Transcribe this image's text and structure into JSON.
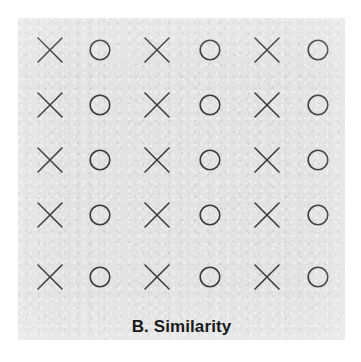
{
  "figure": {
    "caption": "B. Similarity",
    "panel_label": "B",
    "panel_title": "Similarity",
    "background_color": "#ffffff",
    "panel_color": "#e3e3e3",
    "glyph_color": "#3c3c3c",
    "caption_color": "#1a1a1a"
  },
  "grid": {
    "rows": 5,
    "columns": 6,
    "column_pattern": [
      "x",
      "o",
      "x",
      "o",
      "x",
      "o"
    ],
    "column_centers_px": [
      32,
      82,
      139,
      192,
      249,
      300
    ],
    "row_centers_px": [
      32,
      87,
      142,
      197,
      259
    ],
    "glyph_size_px": 24,
    "stroke_width_px": 1.6,
    "cells": [
      [
        "x",
        "o",
        "x",
        "o",
        "x",
        "o"
      ],
      [
        "x",
        "o",
        "x",
        "o",
        "x",
        "o"
      ],
      [
        "x",
        "o",
        "x",
        "o",
        "x",
        "o"
      ],
      [
        "x",
        "o",
        "x",
        "o",
        "x",
        "o"
      ],
      [
        "x",
        "o",
        "x",
        "o",
        "x",
        "o"
      ]
    ],
    "glyph_names": {
      "x": "cross-glyph",
      "o": "circle-glyph"
    }
  },
  "chart_data": {
    "type": "scatter",
    "title": "B. Similarity",
    "xlabel": "",
    "ylabel": "",
    "categories": [
      "column-1",
      "column-2",
      "column-3",
      "column-4",
      "column-5",
      "column-6"
    ],
    "series": [
      {
        "name": "cross",
        "values": [
          5,
          0,
          5,
          0,
          5,
          0
        ]
      },
      {
        "name": "circle",
        "values": [
          0,
          5,
          0,
          5,
          0,
          5
        ]
      }
    ],
    "annotations": [
      "Gestalt principle of similarity: like shapes group into columns"
    ],
    "legend": "none",
    "grid": false
  }
}
